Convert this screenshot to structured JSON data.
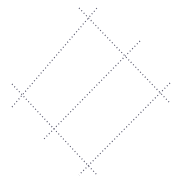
{
  "canvas": {
    "width": 175,
    "height": 181,
    "background_color": "#ffffff",
    "title": "Dotted Geometric Figure"
  },
  "figure": {
    "name": "two-overlapping-dotted-quadrilaterals",
    "stroke_color": "#5a5a6e",
    "stroke_width": 1.2,
    "dash_pattern": "1 2.4",
    "vertices": {
      "top": {
        "x": 88,
        "y": 18
      },
      "left": {
        "x": 22,
        "y": 95
      },
      "right": {
        "x": 160,
        "y": 93
      },
      "bottom": {
        "x": 88,
        "y": 165
      },
      "inner_upper_right": {
        "x": 130,
        "y": 52
      },
      "inner_lower_left": {
        "x": 53,
        "y": 130
      }
    },
    "segments": [
      {
        "name": "edge-top-left",
        "x1": 12,
        "y1": 107,
        "x2": 97,
        "y2": 8
      },
      {
        "name": "edge-top-right",
        "x1": 79,
        "y1": 8,
        "x2": 170,
        "y2": 103
      },
      {
        "name": "edge-bottom-left",
        "x1": 12,
        "y1": 84,
        "x2": 97,
        "y2": 175
      },
      {
        "name": "edge-bottom-right",
        "x1": 170,
        "y1": 83,
        "x2": 79,
        "y2": 175
      },
      {
        "name": "inner-diagonal",
        "x1": 140,
        "y1": 41,
        "x2": 43,
        "y2": 140
      }
    ],
    "overshoot_px": 10
  }
}
